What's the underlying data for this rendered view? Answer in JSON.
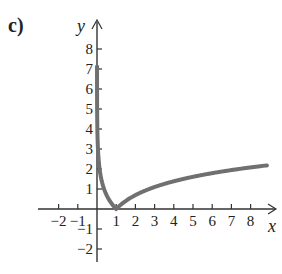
{
  "figure_label": "c)",
  "chart_data": {
    "type": "line",
    "title": "",
    "function": "y = |ln x|",
    "xlabel": "x",
    "ylabel": "y",
    "x_ticks": [
      -2,
      -1,
      1,
      2,
      3,
      4,
      5,
      6,
      7,
      8
    ],
    "y_ticks": [
      -2,
      -1,
      1,
      2,
      3,
      4,
      5,
      6,
      7,
      8
    ],
    "xlim": [
      -3,
      9
    ],
    "ylim": [
      -3,
      9
    ],
    "grid": false,
    "series": [
      {
        "name": "y=|ln x|",
        "x": [
          0.01,
          0.05,
          0.1,
          0.2,
          0.3,
          0.5,
          0.7,
          1,
          1.5,
          2,
          3,
          4,
          5,
          6,
          7,
          8,
          9
        ],
        "values": [
          4.6,
          3.0,
          2.3,
          1.61,
          1.2,
          0.69,
          0.36,
          0,
          0.41,
          0.69,
          1.1,
          1.39,
          1.61,
          1.79,
          1.95,
          2.08,
          2.2
        ]
      }
    ],
    "color": "#707070"
  }
}
